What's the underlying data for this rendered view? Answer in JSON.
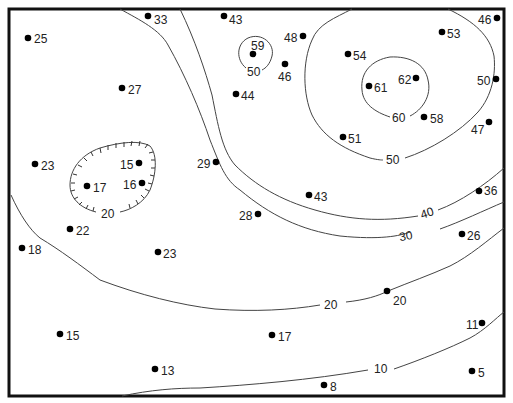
{
  "map": {
    "type": "contour-map",
    "contour_interval": 10,
    "contours": [
      {
        "value": "50",
        "label_pos": [
          254,
          71
        ],
        "note": "small closed loop near 59"
      },
      {
        "value": "60",
        "label_pos": [
          399,
          118
        ]
      },
      {
        "value": "50",
        "label_pos": [
          393,
          159
        ]
      },
      {
        "value": "40",
        "label_pos": [
          427,
          212
        ]
      },
      {
        "value": "30",
        "label_pos": [
          406,
          235
        ]
      },
      {
        "value": "20",
        "label_pos": [
          331,
          304
        ]
      },
      {
        "value": "10",
        "label_pos": [
          381,
          369
        ]
      },
      {
        "value": "20",
        "label_pos": [
          108,
          213
        ],
        "depression": true
      }
    ],
    "points": [
      {
        "value": "25",
        "x": 28,
        "y": 38,
        "side": "right"
      },
      {
        "value": "33",
        "x": 148,
        "y": 16,
        "side": "right"
      },
      {
        "value": "43",
        "x": 224,
        "y": 16,
        "side": "right"
      },
      {
        "value": "59",
        "x": 253,
        "y": 54,
        "side": "above"
      },
      {
        "value": "48",
        "x": 303,
        "y": 36,
        "side": "left"
      },
      {
        "value": "46",
        "x": 285,
        "y": 64,
        "side": "below"
      },
      {
        "value": "44",
        "x": 236,
        "y": 94,
        "side": "right"
      },
      {
        "value": "27",
        "x": 122,
        "y": 88,
        "side": "right"
      },
      {
        "value": "54",
        "x": 348,
        "y": 54,
        "side": "right"
      },
      {
        "value": "53",
        "x": 442,
        "y": 32,
        "side": "right"
      },
      {
        "value": "46",
        "x": 497,
        "y": 18,
        "side": "left"
      },
      {
        "value": "61",
        "x": 369,
        "y": 86,
        "side": "right"
      },
      {
        "value": "62",
        "x": 416,
        "y": 78,
        "side": "left"
      },
      {
        "value": "50",
        "x": 496,
        "y": 79,
        "side": "left"
      },
      {
        "value": "58",
        "x": 424,
        "y": 117,
        "side": "right"
      },
      {
        "value": "47",
        "x": 489,
        "y": 122,
        "side": "left-below"
      },
      {
        "value": "51",
        "x": 343,
        "y": 137,
        "side": "right"
      },
      {
        "value": "23",
        "x": 35,
        "y": 164,
        "side": "right"
      },
      {
        "value": "15",
        "x": 139,
        "y": 163,
        "side": "left"
      },
      {
        "value": "17",
        "x": 87,
        "y": 186,
        "side": "right"
      },
      {
        "value": "16",
        "x": 142,
        "y": 183,
        "side": "left"
      },
      {
        "value": "29",
        "x": 216,
        "y": 162,
        "side": "left"
      },
      {
        "value": "43",
        "x": 309,
        "y": 195,
        "side": "right"
      },
      {
        "value": "28",
        "x": 258,
        "y": 214,
        "side": "left"
      },
      {
        "value": "36",
        "x": 479,
        "y": 191,
        "side": "right"
      },
      {
        "value": "22",
        "x": 70,
        "y": 229,
        "side": "right"
      },
      {
        "value": "18",
        "x": 22,
        "y": 248,
        "side": "right"
      },
      {
        "value": "23",
        "x": 158,
        "y": 252,
        "side": "right"
      },
      {
        "value": "26",
        "x": 462,
        "y": 234,
        "side": "right"
      },
      {
        "value": "20",
        "x": 387,
        "y": 291,
        "side": "below-right"
      },
      {
        "value": "11",
        "x": 482,
        "y": 323,
        "side": "left"
      },
      {
        "value": "15",
        "x": 60,
        "y": 334,
        "side": "right"
      },
      {
        "value": "17",
        "x": 272,
        "y": 335,
        "side": "right"
      },
      {
        "value": "13",
        "x": 155,
        "y": 369,
        "side": "right"
      },
      {
        "value": "8",
        "x": 324,
        "y": 385,
        "side": "right"
      },
      {
        "value": "5",
        "x": 472,
        "y": 371,
        "side": "right"
      }
    ]
  }
}
